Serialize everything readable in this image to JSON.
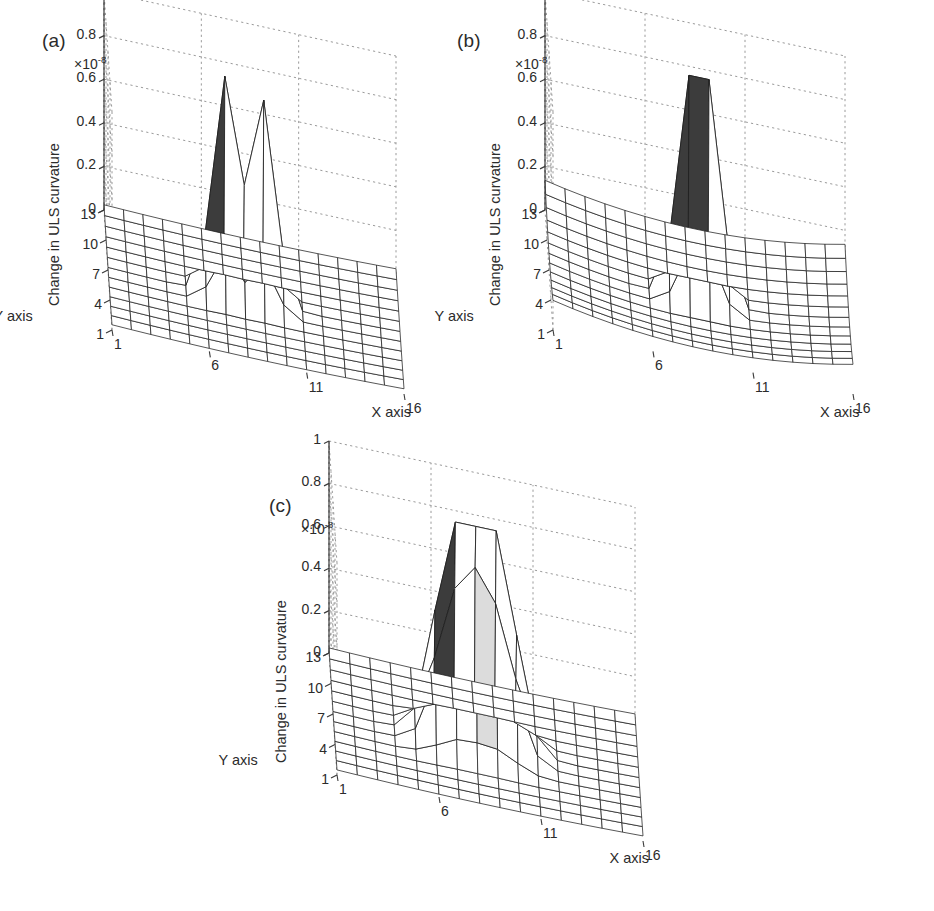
{
  "figure": {
    "background": "#ffffff",
    "caption": ""
  },
  "chart_data": [
    {
      "type": "surface",
      "panel": "a",
      "panel_label": "(a)",
      "title": "",
      "xlabel": "X axis",
      "ylabel": "Y axis",
      "zlabel": "Change in ULS curvature",
      "z_exponent_label": "×10",
      "z_exponent_value": "-8",
      "z_scale": 1e-08,
      "xticks": [
        1,
        6,
        11,
        16
      ],
      "yticks": [
        1,
        4,
        7,
        10,
        13
      ],
      "zticks": [
        0,
        0.2,
        0.4,
        0.6,
        0.8,
        1
      ],
      "xlim": [
        1,
        16
      ],
      "ylim": [
        1,
        13
      ],
      "zlim": [
        0,
        1
      ],
      "grid": true,
      "legend": false,
      "peaks": [
        {
          "x": 7,
          "y": 7,
          "z": 1.0,
          "shaded": "dark"
        },
        {
          "x": 9,
          "y": 7,
          "z": 0.93,
          "shaded": "none"
        }
      ],
      "baseline": "flat",
      "valley_z": 0.0,
      "notes": "two narrow adjacent spikes rising from a flat near-zero mesh"
    },
    {
      "type": "surface",
      "panel": "b",
      "panel_label": "(b)",
      "title": "",
      "xlabel": "X axis",
      "ylabel": "Y axis",
      "zlabel": "Change in ULS curvature",
      "z_exponent_label": "×10",
      "z_exponent_value": "-8",
      "z_scale": 1e-08,
      "xticks": [
        1,
        6,
        11,
        16
      ],
      "yticks": [
        1,
        4,
        7,
        10,
        13
      ],
      "zticks": [
        0,
        0.2,
        0.4,
        0.6,
        0.8,
        1
      ],
      "xlim": [
        1,
        16
      ],
      "ylim": [
        1,
        13
      ],
      "zlim": [
        0,
        1
      ],
      "grid": true,
      "legend": false,
      "peaks": [
        {
          "x": 8,
          "y": 7,
          "z": 0.9,
          "shaded": "dark"
        },
        {
          "x": 9,
          "y": 7,
          "z": 0.91,
          "shaded": "none"
        }
      ],
      "baseline": "curved",
      "valley_z": 0.0,
      "notes": "two adjacent spikes of nearly equal height on a gently warped dish-shaped mesh"
    },
    {
      "type": "surface",
      "panel": "c",
      "panel_label": "(c)",
      "title": "",
      "xlabel": "X axis",
      "ylabel": "Y axis",
      "zlabel": "Change in ULS curvature",
      "z_exponent_label": "×10",
      "z_exponent_value": "-8",
      "z_scale": 1e-08,
      "xticks": [
        1,
        6,
        11,
        16
      ],
      "yticks": [
        1,
        4,
        7,
        10,
        13
      ],
      "zticks": [
        0,
        0.2,
        0.4,
        0.6,
        0.8,
        1
      ],
      "xlim": [
        1,
        16
      ],
      "ylim": [
        1,
        13
      ],
      "zlim": [
        0,
        1
      ],
      "grid": true,
      "legend": false,
      "peaks": [
        {
          "x": 7,
          "y": 7,
          "z": 1.0,
          "shaded": "dark"
        },
        {
          "x": 9,
          "y": 7,
          "z": 0.94,
          "shaded": "none"
        }
      ],
      "baseline": "flat",
      "valley_z": 0.55,
      "notes": "two broad peaks joined by a light-grey shaded saddle at about 0.55"
    }
  ],
  "panels": {
    "a": {
      "label": "(a)",
      "exp_prefix": "×10",
      "exp_sup": "-8",
      "z_title": "Change in ULS curvature",
      "x_title": "X axis",
      "y_title": "Y axis",
      "zticks": [
        "1",
        "0.8",
        "0.6",
        "0.4",
        "0.2",
        "0"
      ],
      "xticks": [
        "1",
        "6",
        "11",
        "16"
      ],
      "yticks": [
        "13",
        "10",
        "7",
        "4",
        "1"
      ]
    },
    "b": {
      "label": "(b)",
      "exp_prefix": "×10",
      "exp_sup": "-8",
      "z_title": "Change in ULS curvature",
      "x_title": "X axis",
      "y_title": "Y axis",
      "zticks": [
        "1",
        "0.8",
        "0.6",
        "0.4",
        "0.2",
        "0"
      ],
      "xticks": [
        "1",
        "6",
        "11",
        "16"
      ],
      "yticks": [
        "13",
        "10",
        "7",
        "4",
        "1"
      ]
    },
    "c": {
      "label": "(c)",
      "exp_prefix": "×10",
      "exp_sup": "-8",
      "z_title": "Change in ULS curvature",
      "x_title": "X axis",
      "y_title": "Y axis",
      "zticks": [
        "1",
        "0.8",
        "0.6",
        "0.4",
        "0.2",
        "0"
      ],
      "xticks": [
        "1",
        "6",
        "11",
        "16"
      ],
      "yticks": [
        "13",
        "10",
        "7",
        "4",
        "1"
      ]
    }
  },
  "colors": {
    "mesh_line": "#1f1f1f",
    "grid_dash": "#9a9a9a",
    "axis_line": "#3a3a3a",
    "peak_dark": "#3c3c3c",
    "peak_light": "#dcdcdc",
    "surface_fill": "#ffffff",
    "text": "#2b2b2b"
  }
}
